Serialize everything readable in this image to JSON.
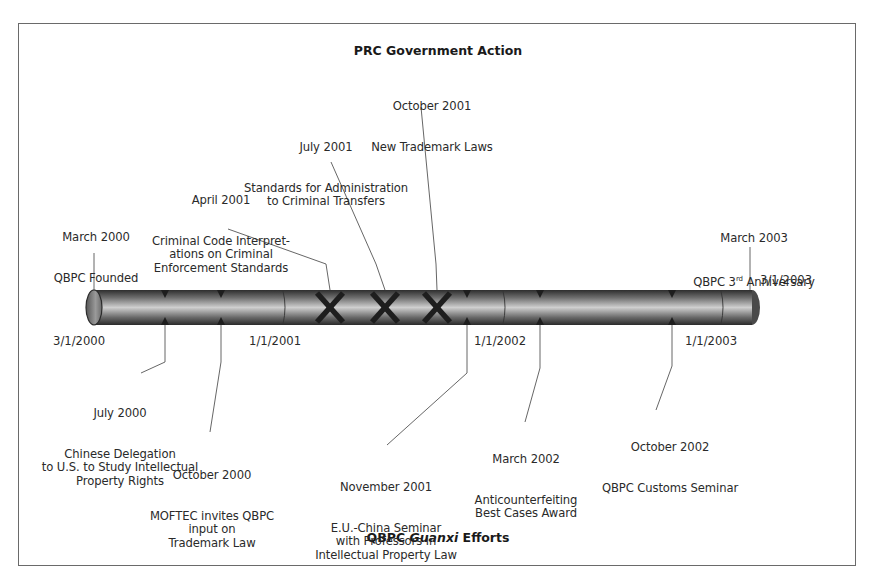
{
  "diagram": {
    "type": "timeline",
    "top_header": "PRC Government Action",
    "bottom_header_prefix": "QBPC ",
    "bottom_header_italic": "Guanxi",
    "bottom_header_suffix": " Efforts",
    "axis_dates": {
      "start": "3/1/2000",
      "y2001": "1/1/2001",
      "y2002": "1/1/2002",
      "y2003": "1/1/2003",
      "end": "3/1/2003"
    },
    "government_actions": [
      {
        "date": "April 2001",
        "text": "Criminal Code Interpret-\nations on Criminal\nEnforcement Standards",
        "marker": "x"
      },
      {
        "date": "July 2001",
        "text": "Standards for Administration\nto Criminal Transfers",
        "marker": "x"
      },
      {
        "date": "October 2001",
        "text": "New Trademark Laws",
        "marker": "x"
      }
    ],
    "qbpc_milestones_top": [
      {
        "date": "March 2000",
        "text": "QBPC Founded"
      },
      {
        "date": "March 2003",
        "text": "QBPC 3rd Anniversary",
        "text_main": "QBPC 3",
        "sup": "rd",
        "text_tail": " Anniversary"
      }
    ],
    "guanxi_efforts": [
      {
        "date": "July 2000",
        "text": "Chinese Delegation\nto U.S. to Study Intellectual\nProperty Rights"
      },
      {
        "date": "October 2000",
        "text": "MOFTEC invites QBPC\ninput on\nTrademark Law"
      },
      {
        "date": "November 2001",
        "text": "E.U.-China Seminar\nwith Professors in\nIntellectual Property Law"
      },
      {
        "date": "March 2002",
        "text": "Anticounterfeiting\nBest Cases Award"
      },
      {
        "date": "October 2002",
        "text": "QBPC Customs Seminar"
      }
    ]
  },
  "colors": {
    "frame": "#6a6a6a",
    "bar_dark": "#3c3c3c",
    "bar_light": "#c8c8c8",
    "marker": "#1e1e1e",
    "text": "#2a2a2a"
  }
}
